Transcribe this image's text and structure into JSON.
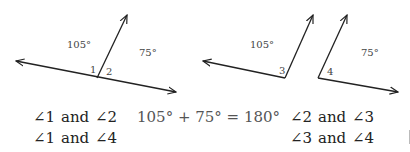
{
  "figure1": {
    "angle_left_label": "105°",
    "angle_right_label": "75°",
    "angle1": "1",
    "angle2": "2"
  },
  "figure2": {
    "angle_left_label": "105°",
    "angle_right_label": "75°",
    "angle3": "3",
    "angle4": "4"
  },
  "statements": {
    "row1_left": {
      "a": "∠1",
      "and": "and",
      "b": "∠2"
    },
    "equation": "105° + 75° = 180°",
    "row1_right": {
      "a": "∠2",
      "and": "and",
      "b": "∠3"
    },
    "row2_left": {
      "a": "∠1",
      "and": "and",
      "b": "∠4"
    },
    "row2_right": {
      "a": "∠3",
      "and": "and",
      "b": "∠4"
    }
  }
}
